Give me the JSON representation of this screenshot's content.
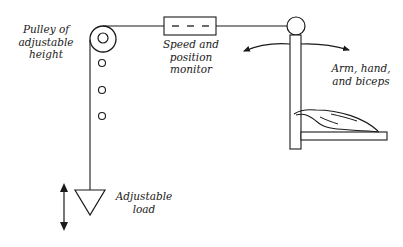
{
  "diagram": {
    "labels": {
      "pulley": [
        "Pulley of",
        "adjustable",
        "height"
      ],
      "monitor": [
        "Speed and",
        "position",
        "monitor"
      ],
      "arm": [
        "Arm, hand,",
        "and biceps"
      ],
      "load": [
        "Adjustable",
        "load"
      ]
    },
    "colors": {
      "stroke": "#1a1a1a",
      "background": "#ffffff"
    }
  }
}
